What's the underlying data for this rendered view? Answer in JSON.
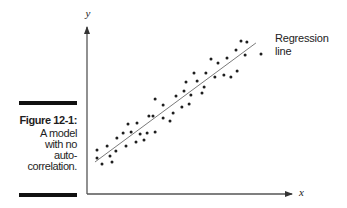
{
  "caption": {
    "title": "Figure 12-1:",
    "lines": [
      "A model",
      "with no",
      "auto-",
      "correlation."
    ]
  },
  "chart_data": {
    "type": "scatter",
    "title": "",
    "xlabel": "x",
    "ylabel": "y",
    "xlim": [
      0,
      10
    ],
    "ylim": [
      0,
      10
    ],
    "grid": false,
    "ticks": false,
    "legend": null,
    "points": [
      [
        0.49,
        2.56
      ],
      [
        0.49,
        2.09
      ],
      [
        0.73,
        1.74
      ],
      [
        0.98,
        2.79
      ],
      [
        1.12,
        2.21
      ],
      [
        1.22,
        1.86
      ],
      [
        1.41,
        2.5
      ],
      [
        1.46,
        3.26
      ],
      [
        1.76,
        3.55
      ],
      [
        1.9,
        2.79
      ],
      [
        2.0,
        4.07
      ],
      [
        2.15,
        3.6
      ],
      [
        2.39,
        3.02
      ],
      [
        2.44,
        4.13
      ],
      [
        2.59,
        3.49
      ],
      [
        2.78,
        3.14
      ],
      [
        2.93,
        3.55
      ],
      [
        3.02,
        4.53
      ],
      [
        3.32,
        3.6
      ],
      [
        3.32,
        5.52
      ],
      [
        3.22,
        4.53
      ],
      [
        3.71,
        5.17
      ],
      [
        3.71,
        4.42
      ],
      [
        4.05,
        4.24
      ],
      [
        4.2,
        4.71
      ],
      [
        4.34,
        5.7
      ],
      [
        4.63,
        5.06
      ],
      [
        4.73,
        5.99
      ],
      [
        4.83,
        6.51
      ],
      [
        4.98,
        5.23
      ],
      [
        5.07,
        5.76
      ],
      [
        5.22,
        7.03
      ],
      [
        5.37,
        6.57
      ],
      [
        5.61,
        5.87
      ],
      [
        5.71,
        6.22
      ],
      [
        5.8,
        7.03
      ],
      [
        6.05,
        7.85
      ],
      [
        6.24,
        6.8
      ],
      [
        6.39,
        7.62
      ],
      [
        6.68,
        6.92
      ],
      [
        6.83,
        7.91
      ],
      [
        7.02,
        6.8
      ],
      [
        7.27,
        8.37
      ],
      [
        7.32,
        7.15
      ],
      [
        7.51,
        8.9
      ],
      [
        7.71,
        8.08
      ],
      [
        7.8,
        8.84
      ],
      [
        8.49,
        8.14
      ]
    ],
    "regression_line": {
      "from": [
        0.39,
        1.86
      ],
      "to": [
        8.24,
        8.78
      ]
    },
    "annotations": [
      {
        "text_lines": [
          "Regression",
          "line"
        ],
        "target": "regression_line",
        "placement": "right of line end"
      }
    ],
    "colors": {
      "points": "#1e1e1e",
      "axes": "#555555",
      "regression_line": "#7a7a7a"
    }
  }
}
